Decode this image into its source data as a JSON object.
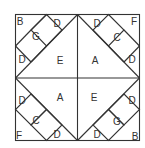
{
  "diagram": {
    "stroke_color": "#333333",
    "background": "#ffffff",
    "labels": [
      {
        "id": "tl-B",
        "text": "B",
        "x": 20,
        "y": 21
      },
      {
        "id": "tl-G",
        "text": "G",
        "x": 36,
        "y": 36
      },
      {
        "id": "tl-D1",
        "text": "D",
        "x": 57,
        "y": 23
      },
      {
        "id": "tl-D2",
        "text": "D",
        "x": 22,
        "y": 59
      },
      {
        "id": "tl-E",
        "text": "E",
        "x": 60,
        "y": 60
      },
      {
        "id": "tr-D1",
        "text": "D",
        "x": 97,
        "y": 23
      },
      {
        "id": "tr-F",
        "text": "F",
        "x": 134,
        "y": 21
      },
      {
        "id": "tr-C",
        "text": "C",
        "x": 117,
        "y": 37
      },
      {
        "id": "tr-D2",
        "text": "D",
        "x": 132,
        "y": 59
      },
      {
        "id": "tr-A",
        "text": "A",
        "x": 95,
        "y": 60
      },
      {
        "id": "bl-D1",
        "text": "D",
        "x": 22,
        "y": 100
      },
      {
        "id": "bl-A",
        "text": "A",
        "x": 60,
        "y": 97
      },
      {
        "id": "bl-C",
        "text": "C",
        "x": 36,
        "y": 120
      },
      {
        "id": "bl-F",
        "text": "F",
        "x": 19,
        "y": 135
      },
      {
        "id": "bl-D2",
        "text": "D",
        "x": 57,
        "y": 134
      },
      {
        "id": "br-E",
        "text": "E",
        "x": 94,
        "y": 97
      },
      {
        "id": "br-D1",
        "text": "D",
        "x": 132,
        "y": 100
      },
      {
        "id": "br-G",
        "text": "G",
        "x": 117,
        "y": 121
      },
      {
        "id": "br-D2",
        "text": "D",
        "x": 97,
        "y": 134
      },
      {
        "id": "br-B",
        "text": "B",
        "x": 135,
        "y": 136
      }
    ]
  }
}
